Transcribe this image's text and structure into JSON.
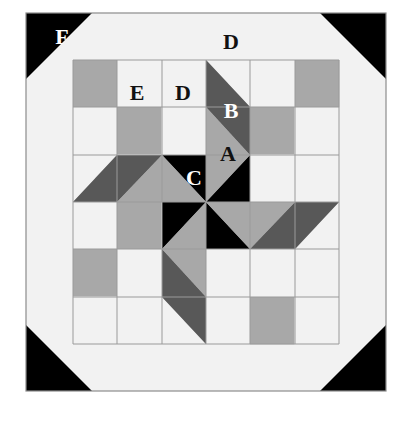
{
  "figure": {
    "kind": "quilt-block-diagram",
    "canvas": {
      "width": 411,
      "height": 429
    },
    "block": {
      "x": 26,
      "y": 13,
      "width": 360,
      "height": 378
    }
  },
  "palette": {
    "background": "#ffffff",
    "white": "#f2f2f2",
    "light_gray": "#ededed",
    "medium_gray": "#a8a8a8",
    "dark_gray": "#585858",
    "black": "#000000",
    "outline": "#9a9a9a",
    "border": "#8c8c8c",
    "label_dark": "#111111",
    "label_light": "#ffffff"
  },
  "labels": [
    {
      "id": "A",
      "text": "A",
      "x": 228,
      "y": 156,
      "color": "#111111",
      "note": "center star point, medium gray kite"
    },
    {
      "id": "B",
      "text": "B",
      "x": 231,
      "y": 113,
      "color": "#ffffff",
      "note": "dark gray star point triangle"
    },
    {
      "id": "C",
      "text": "C",
      "x": 194,
      "y": 180,
      "color": "#ffffff",
      "note": "black corner triangle of star arm"
    },
    {
      "id": "D_top",
      "text": "D",
      "x": 231,
      "y": 44,
      "color": "#111111",
      "note": "white outer border strip"
    },
    {
      "id": "D_inner",
      "text": "D",
      "x": 183,
      "y": 95,
      "color": "#111111",
      "note": "white square in second round"
    },
    {
      "id": "E",
      "text": "E",
      "x": 137,
      "y": 95,
      "color": "#111111",
      "note": "medium gray square in second round"
    },
    {
      "id": "F",
      "text": "F",
      "x": 62,
      "y": 39,
      "color": "#ffffff",
      "note": "black corner triangle of outer border"
    }
  ],
  "legend_letters": [
    "A",
    "B",
    "C",
    "D",
    "E",
    "F"
  ],
  "description": {
    "grid": "Inner 6x6 patch grid surrounded by a plain outer border with black corner triangles",
    "motif": "Four-armed rotating pinwheel star at the center built from light, medium and dark gray half-square and quarter-square triangles"
  }
}
